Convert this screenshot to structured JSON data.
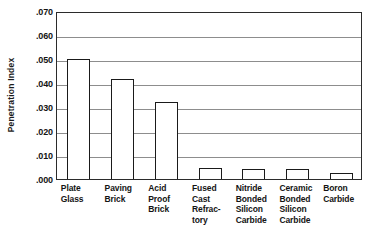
{
  "chart_data": {
    "type": "bar",
    "title": "",
    "xlabel": "",
    "ylabel": "Penetration Index",
    "ylim": [
      0.0,
      0.07
    ],
    "grid": true,
    "legend": "none",
    "ytick_labels": [
      ".070",
      ".060",
      ".050",
      ".040",
      ".030",
      ".020",
      ".010",
      ".000"
    ],
    "ytick_values": [
      0.07,
      0.06,
      0.05,
      0.04,
      0.03,
      0.02,
      0.01,
      0.0
    ],
    "categories": [
      "Plate Glass",
      "Paving Brick",
      "Acid Proof Brick",
      "Fused Cast Refractory",
      "Nitride Bonded Silicon Carbide",
      "Ceramic Bonded Silicon Carbide",
      "Boron Carbide"
    ],
    "category_lines": [
      [
        "Plate",
        "Glass"
      ],
      [
        "Paving",
        "Brick"
      ],
      [
        "Acid",
        "Proof",
        "Brick"
      ],
      [
        "Fused",
        "Cast",
        "Refrac-",
        "tory"
      ],
      [
        "Nitride",
        "Bonded",
        "Silicon",
        "Carbide"
      ],
      [
        "Ceramic",
        "Bonded",
        "Silicon",
        "Carbide"
      ],
      [
        "Boron",
        "Carbide"
      ]
    ],
    "values": [
      0.05,
      0.0415,
      0.032,
      0.0045,
      0.0042,
      0.004,
      0.0025
    ]
  },
  "style": {
    "bar_fill": "#ffffff",
    "bar_stroke": "#1a1a1a",
    "grid_color": "#8d8d8d",
    "axis_color": "#2b2b2b",
    "text_color": "#141414",
    "background": "#ffffff"
  }
}
